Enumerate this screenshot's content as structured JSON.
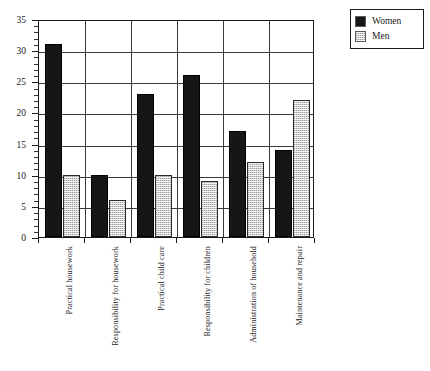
{
  "chart_data": {
    "type": "bar",
    "title": "",
    "subtitle": "",
    "xlabel": "",
    "ylabel": "",
    "ylim": [
      0,
      35
    ],
    "ytick_step": 5,
    "yminor_step": 1,
    "grid": true,
    "legend_position": "top-right",
    "categories": [
      "Practical housework",
      "Responsibility for housework",
      "Practical child care",
      "Responsibility for children",
      "Administration of household",
      "Maintenance and repair"
    ],
    "ytick_labels": [
      "0",
      "5",
      "10",
      "15",
      "20",
      "25",
      "30",
      "35"
    ],
    "series": [
      {
        "name": "Women",
        "color": "#161616",
        "values": [
          31,
          10,
          23,
          26,
          17,
          14
        ]
      },
      {
        "name": "Men",
        "color": "#cfcfcf",
        "values": [
          10,
          6,
          10,
          9,
          12,
          22
        ]
      }
    ]
  },
  "legend": {
    "items": [
      {
        "label": "Women",
        "swatch": "black"
      },
      {
        "label": "Men",
        "swatch": "gray"
      }
    ]
  },
  "caption": {
    "text": ""
  }
}
